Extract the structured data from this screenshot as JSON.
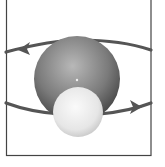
{
  "diagram": {
    "frame": {
      "x": 6,
      "y": 0,
      "width": 145,
      "height": 156,
      "stroke": "#444444"
    },
    "central_body": {
      "cx": 77,
      "cy": 79,
      "r": 43,
      "color_light": "#b8b8b8",
      "color_dark": "#3e3e3e",
      "label": ""
    },
    "center_marker": {
      "cx": 77,
      "cy": 80,
      "r": 1.2,
      "color": "#f0f0f0"
    },
    "orbiting_body": {
      "cx": 78,
      "cy": 112,
      "r": 25,
      "color_light": "#fafafa",
      "color_dark": "#c4c4c4",
      "label": ""
    },
    "orbit": {
      "color": "#555555",
      "direction_left_arrow": "pointing-left",
      "direction_right_arrow": "pointing-right"
    }
  }
}
